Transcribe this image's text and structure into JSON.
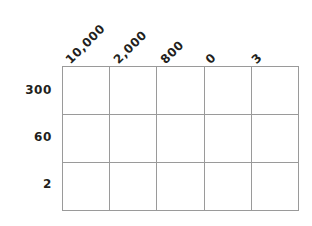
{
  "figure": {
    "kind": "matrix-grid-worksheet",
    "background_color": "#ffffff",
    "grid_line_color": "#9a9a9a",
    "text_color": "#231f20"
  },
  "table": {
    "column_headers": [
      "10,000",
      "2,000",
      "800",
      "0",
      "3"
    ],
    "row_headers": [
      "300",
      "60",
      "2"
    ],
    "header_rotation_degrees": 45,
    "rows": 3,
    "columns": 5,
    "cells": [
      [
        "",
        "",
        "",
        "",
        ""
      ],
      [
        "",
        "",
        "",
        "",
        ""
      ],
      [
        "",
        "",
        "",
        "",
        ""
      ]
    ]
  }
}
